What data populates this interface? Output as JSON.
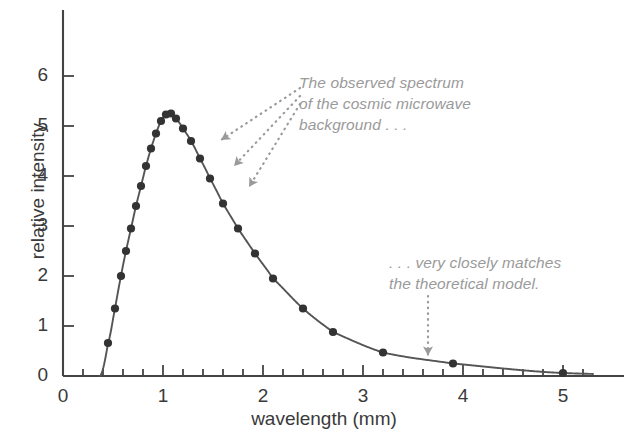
{
  "chart_data": {
    "type": "line",
    "title": "",
    "xlabel": "wavelength (mm)",
    "ylabel": "relative intensity",
    "xlim": [
      0,
      5.3
    ],
    "ylim": [
      0,
      6.6
    ],
    "xticks": [
      0,
      1,
      2,
      3,
      4,
      5
    ],
    "xtick_labels": [
      "0",
      "1",
      "2",
      "3",
      "4",
      "5"
    ],
    "x_minor_step": 0.2,
    "yticks": [
      0,
      1,
      2,
      3,
      4,
      5,
      6
    ],
    "ytick_labels": [
      "0",
      "1",
      "2",
      "3",
      "4",
      "5",
      "6"
    ],
    "grid": false,
    "legend": "none",
    "series": [
      {
        "name": "cosmic microwave background spectrum",
        "marker": "filled-circle",
        "marker_color": "#333333",
        "line_color": "#555555",
        "x": [
          0.45,
          0.52,
          0.58,
          0.63,
          0.68,
          0.73,
          0.78,
          0.83,
          0.88,
          0.93,
          0.98,
          1.03,
          1.08,
          1.13,
          1.2,
          1.28,
          1.37,
          1.47,
          1.6,
          1.75,
          1.92,
          2.1,
          2.4,
          2.7,
          3.2,
          3.9,
          5.0
        ],
        "y": [
          0.66,
          1.35,
          2.0,
          2.5,
          2.95,
          3.4,
          3.8,
          4.2,
          4.55,
          4.85,
          5.1,
          5.23,
          5.25,
          5.15,
          4.95,
          4.7,
          4.35,
          3.95,
          3.45,
          2.95,
          2.45,
          1.95,
          1.35,
          0.88,
          0.47,
          0.25,
          0.06
        ]
      }
    ],
    "curve_domain": [
      0.37,
      5.3
    ],
    "annotations": [
      {
        "id": "observed-spectrum",
        "text": "The observed spectrum\nof the cosmic microwave\nbackground . . .",
        "style": "italic-gray",
        "arrows": 3,
        "arrow_style": "dotted",
        "points_to": [
          [
            1.47,
            4.72
          ],
          [
            1.6,
            4.2
          ],
          [
            1.75,
            3.78
          ]
        ]
      },
      {
        "id": "theoretical-model",
        "text": ". . . very closely matches\nthe theoretical model.",
        "style": "italic-gray",
        "arrows": 1,
        "arrow_style": "dotted-vertical",
        "points_to": [
          [
            3.65,
            0.33
          ]
        ]
      }
    ]
  },
  "colors": {
    "background": "#ffffff",
    "axis": "#444444",
    "curve": "#555555",
    "marker": "#333333",
    "annotation": "#9a9a9a",
    "tick_label": "#3a3a3a"
  }
}
